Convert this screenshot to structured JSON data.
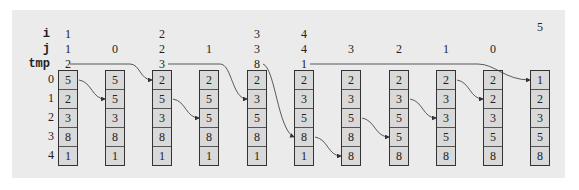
{
  "diagram": {
    "row_labels": {
      "i": "i",
      "j": "j",
      "tmp": "tmp"
    },
    "index_labels": [
      "0",
      "1",
      "2",
      "3",
      "4"
    ],
    "columns": [
      {
        "i": "1",
        "j": "1",
        "tmp": "2",
        "array": [
          "5",
          "2",
          "3",
          "8",
          "1"
        ]
      },
      {
        "i": "",
        "j": "0",
        "tmp": "",
        "array": [
          "5",
          "5",
          "3",
          "8",
          "1"
        ]
      },
      {
        "i": "2",
        "j": "2",
        "tmp": "3",
        "array": [
          "2",
          "5",
          "3",
          "8",
          "1"
        ]
      },
      {
        "i": "",
        "j": "1",
        "tmp": "",
        "array": [
          "2",
          "5",
          "5",
          "8",
          "1"
        ]
      },
      {
        "i": "3",
        "j": "3",
        "tmp": "8",
        "array": [
          "2",
          "3",
          "5",
          "8",
          "1"
        ]
      },
      {
        "i": "4",
        "j": "4",
        "tmp": "1",
        "array": [
          "2",
          "3",
          "5",
          "8",
          "1"
        ]
      },
      {
        "i": "",
        "j": "3",
        "tmp": "",
        "array": [
          "2",
          "3",
          "5",
          "8",
          "8"
        ]
      },
      {
        "i": "",
        "j": "2",
        "tmp": "",
        "array": [
          "2",
          "3",
          "5",
          "5",
          "8"
        ]
      },
      {
        "i": "",
        "j": "1",
        "tmp": "",
        "array": [
          "2",
          "3",
          "3",
          "5",
          "8"
        ]
      },
      {
        "i": "",
        "j": "0",
        "tmp": "",
        "array": [
          "2",
          "2",
          "3",
          "5",
          "8"
        ]
      },
      {
        "i": "5",
        "j": "",
        "tmp": "",
        "array": [
          "1",
          "2",
          "3",
          "5",
          "8"
        ]
      }
    ]
  }
}
